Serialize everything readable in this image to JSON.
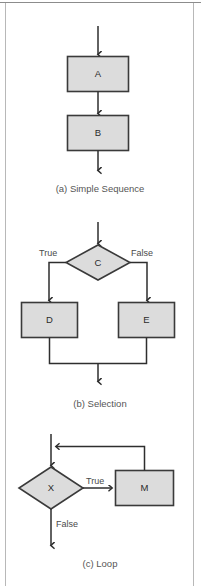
{
  "figure": {
    "background_color": "#ffffff",
    "node_fill": "#dcdcdc",
    "node_stroke": "#3a3a3a",
    "edge_color": "#2e2e2e",
    "caption_color": "#555555"
  },
  "panels": [
    {
      "id": "simple-sequence",
      "caption": "(a) Simple Sequence",
      "nodes": [
        {
          "id": "A",
          "label": "A",
          "shape": "rectangle"
        },
        {
          "id": "B",
          "label": "B",
          "shape": "rectangle"
        }
      ],
      "edges": [
        {
          "from": "entry",
          "to": "A",
          "label": ""
        },
        {
          "from": "A",
          "to": "B",
          "label": ""
        },
        {
          "from": "B",
          "to": "exit",
          "label": ""
        }
      ]
    },
    {
      "id": "selection",
      "caption": "(b) Selection",
      "nodes": [
        {
          "id": "C",
          "label": "C",
          "shape": "diamond"
        },
        {
          "id": "D",
          "label": "D",
          "shape": "rectangle"
        },
        {
          "id": "E",
          "label": "E",
          "shape": "rectangle"
        }
      ],
      "edges": [
        {
          "from": "entry",
          "to": "C",
          "label": ""
        },
        {
          "from": "C",
          "to": "D",
          "label": "True"
        },
        {
          "from": "C",
          "to": "E",
          "label": "False"
        },
        {
          "from": "D",
          "to": "merge",
          "label": ""
        },
        {
          "from": "E",
          "to": "merge",
          "label": ""
        },
        {
          "from": "merge",
          "to": "exit",
          "label": ""
        }
      ]
    },
    {
      "id": "loop",
      "caption": "(c) Loop",
      "nodes": [
        {
          "id": "X",
          "label": "X",
          "shape": "diamond"
        },
        {
          "id": "M",
          "label": "M",
          "shape": "rectangle"
        }
      ],
      "edges": [
        {
          "from": "entry",
          "to": "X",
          "label": ""
        },
        {
          "from": "X",
          "to": "M",
          "label": "True"
        },
        {
          "from": "X",
          "to": "exit",
          "label": "False"
        },
        {
          "from": "M",
          "to": "X",
          "label": ""
        }
      ]
    }
  ],
  "labels": {
    "node_a": "A",
    "node_b": "B",
    "node_c": "C",
    "node_d": "D",
    "node_e": "E",
    "node_x": "X",
    "node_m": "M",
    "true_1": "True",
    "false_1": "False",
    "true_2": "True",
    "false_2": "False",
    "caption_a": "(a) Simple Sequence",
    "caption_b": "(b) Selection",
    "caption_c": "(c) Loop"
  }
}
